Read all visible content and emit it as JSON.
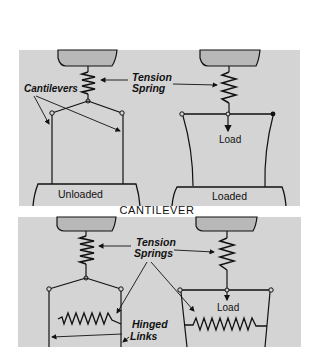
{
  "figure": {
    "caption": "CANTILEVER",
    "top_panel": {
      "labels": {
        "cantilevers": "Cantilevers",
        "tension_line1": "Tension",
        "tension_line2": "Spring",
        "load": "Load",
        "unloaded": "Unloaded",
        "loaded": "Loaded"
      }
    },
    "bottom_panel": {
      "labels": {
        "tension_line1": "Tension",
        "tension_line2": "Springs",
        "load": "Load",
        "hinged_line1": "Hinged",
        "hinged_line2": "Links"
      }
    },
    "colors": {
      "panel_gray": "#d4d4d4",
      "block_gray": "#b8b8b8",
      "ink": "#111111",
      "background": "#ffffff"
    }
  }
}
